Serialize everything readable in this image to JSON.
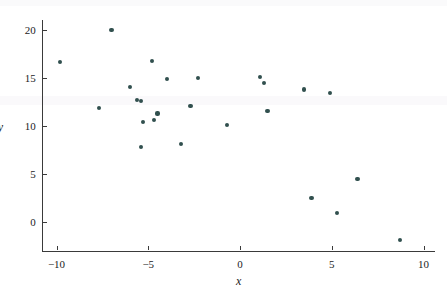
{
  "chart_data": {
    "type": "scatter",
    "title": "",
    "xlabel": "x",
    "ylabel": "y",
    "xlim": [
      -11.5,
      11.0
    ],
    "ylim": [
      -3.5,
      21.5
    ],
    "grid": false,
    "legend": null,
    "marker_color": "#31504e",
    "axis_color": "#3a3a3a",
    "background_color": "#ffffff",
    "xticks": [
      -10,
      -5,
      0,
      5,
      10
    ],
    "xticklabels": [
      "−10",
      "−5",
      "0",
      "5",
      "10"
    ],
    "yticks": [
      0,
      5,
      10,
      15,
      20
    ],
    "yticklabels": [
      "0",
      "5",
      "10",
      "15",
      "20"
    ],
    "n_points": 30,
    "points": [
      {
        "x": -9.8,
        "y": 16.7
      },
      {
        "x": -7.7,
        "y": 11.9
      },
      {
        "x": -7.0,
        "y": 20.0
      },
      {
        "x": -6.0,
        "y": 14.1
      },
      {
        "x": -5.6,
        "y": 12.7
      },
      {
        "x": -5.4,
        "y": 12.6
      },
      {
        "x": -5.3,
        "y": 10.4
      },
      {
        "x": -5.4,
        "y": 7.8
      },
      {
        "x": -4.8,
        "y": 16.8
      },
      {
        "x": -4.7,
        "y": 10.6
      },
      {
        "x": -4.5,
        "y": 11.3
      },
      {
        "x": -4.0,
        "y": 14.9
      },
      {
        "x": -3.2,
        "y": 8.1
      },
      {
        "x": -2.7,
        "y": 12.1
      },
      {
        "x": -2.3,
        "y": 15.0
      },
      {
        "x": -0.7,
        "y": 10.1
      },
      {
        "x": 1.1,
        "y": 15.1
      },
      {
        "x": 1.3,
        "y": 14.5
      },
      {
        "x": 1.5,
        "y": 11.6
      },
      {
        "x": 3.5,
        "y": 13.8
      },
      {
        "x": 4.9,
        "y": 13.4
      },
      {
        "x": 3.9,
        "y": 2.5
      },
      {
        "x": 5.3,
        "y": 0.9
      },
      {
        "x": 6.4,
        "y": 4.5
      },
      {
        "x": 8.7,
        "y": -1.9
      }
    ]
  }
}
